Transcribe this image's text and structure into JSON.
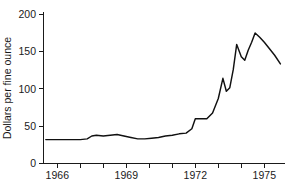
{
  "chart_data": {
    "type": "line",
    "title": "",
    "subtitle": "",
    "xlabel": "",
    "ylabel": "Dollars per fine ounce",
    "xlim": [
      1965.4,
      1975.9
    ],
    "ylim": [
      0,
      210
    ],
    "grid": false,
    "legend": null,
    "y_ticks": [
      0,
      50,
      100,
      150,
      200
    ],
    "y_tick_labels": [
      "0",
      "50",
      "100",
      "150",
      "200"
    ],
    "x_ticks": [
      1966,
      1967,
      1968,
      1969,
      1970,
      1971,
      1972,
      1973,
      1974,
      1975
    ],
    "x_tick_labels": [
      "1966",
      "",
      "",
      "1969",
      "",
      "",
      "1972",
      "",
      "",
      "1975"
    ],
    "x_labeled_ticks": [
      1966,
      1969,
      1972,
      1975
    ],
    "series": [
      {
        "name": "Gold price",
        "color": "#111111",
        "x": [
          1965.5,
          1966.0,
          1966.5,
          1967.0,
          1967.3,
          1967.5,
          1967.7,
          1968.0,
          1968.3,
          1968.6,
          1968.9,
          1969.2,
          1969.5,
          1969.8,
          1970.1,
          1970.4,
          1970.7,
          1971.0,
          1971.3,
          1971.6,
          1971.85,
          1972.0,
          1972.2,
          1972.5,
          1972.75,
          1973.0,
          1973.2,
          1973.35,
          1973.5,
          1973.65,
          1973.8,
          1974.0,
          1974.15,
          1974.3,
          1974.45,
          1974.6,
          1974.8,
          1975.0,
          1975.2,
          1975.45,
          1975.7
        ],
        "y": [
          33,
          33,
          33,
          33,
          34,
          38,
          39,
          38,
          39,
          40,
          38,
          36,
          34,
          34,
          35,
          36,
          38,
          39,
          41,
          42,
          48,
          62,
          62,
          62,
          70,
          90,
          118,
          100,
          105,
          130,
          165,
          148,
          143,
          157,
          168,
          181,
          175,
          168,
          160,
          150,
          138
        ]
      }
    ],
    "annotations": []
  },
  "axis": {
    "y_label": "Dollars per fine ounce"
  }
}
